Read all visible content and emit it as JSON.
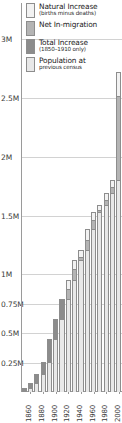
{
  "chart_data": {
    "type": "bar",
    "title": "",
    "subtitle": "",
    "xlabel": "",
    "ylabel": "",
    "grid": true,
    "legend_position": "top-left",
    "stacked": true,
    "ylim": [
      0,
      3300000
    ],
    "ytick_labels": [
      "3M",
      "2.5M",
      "2M",
      "1.5M",
      "1M",
      "0.75M",
      "0.5M",
      "0.25M"
    ],
    "ytick_values": [
      3000000,
      2500000,
      2000000,
      1500000,
      1000000,
      750000,
      500000,
      250000
    ],
    "categories": [
      1850,
      1860,
      1870,
      1880,
      1890,
      1900,
      1910,
      1920,
      1930,
      1940,
      1950,
      1960,
      1970,
      1980,
      1990,
      2000
    ],
    "xtick_labels": [
      "1860",
      "1880",
      "1900",
      "1920",
      "1940",
      "1960",
      "1980",
      "2000"
    ],
    "xtick_values": [
      1860,
      1880,
      1900,
      1920,
      1940,
      1960,
      1980,
      2000
    ],
    "series": [
      {
        "name": "Population at previous census",
        "color": "#e8e8e8",
        "values": [
          0,
          35000,
          80000,
          150000,
          255000,
          450000,
          620000,
          790000,
          950000,
          1120000,
          1210000,
          1390000,
          1530000,
          1590000,
          1690000,
          1800000
        ]
      },
      {
        "name": "Total increase (1850-1910 only)",
        "color": "#8c8c8c",
        "values": [
          35000,
          45000,
          70000,
          105000,
          195000,
          170000,
          170000,
          0,
          0,
          0,
          0,
          0,
          0,
          0,
          0,
          0
        ]
      },
      {
        "name": "Net in-migration",
        "color": "#b4b4b4",
        "values": [
          0,
          0,
          0,
          0,
          0,
          0,
          0,
          90000,
          95000,
          30000,
          85000,
          75000,
          15000,
          45000,
          55000,
          720000
        ]
      },
      {
        "name": "Natural increase (births minus deaths)",
        "color": "#f2f2f2",
        "values": [
          0,
          0,
          0,
          0,
          0,
          0,
          0,
          70000,
          75000,
          60000,
          95000,
          65000,
          45000,
          55000,
          55000,
          200000
        ]
      }
    ]
  },
  "legend": {
    "items": [
      {
        "label": "Natural Increase",
        "sub": "(births minus deaths)",
        "color": "#f2f2f2"
      },
      {
        "label": "Net In-migration",
        "sub": "",
        "color": "#b4b4b4"
      },
      {
        "label": "Total Increase",
        "sub": "(1850–1910 only)",
        "color": "#8c8c8c"
      },
      {
        "label": "Population at",
        "sub": "previous census",
        "color": "#e8e8e8"
      }
    ]
  },
  "colors": {
    "grid": "#d2d2d2",
    "axis": "#9a9a9a",
    "bar_outline": "#8d8d8d",
    "text": "#1a1a1a",
    "background": "#ffffff"
  }
}
